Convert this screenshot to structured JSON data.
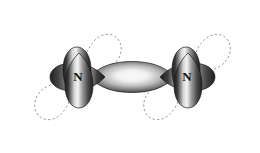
{
  "figure": {
    "background_color": "#ffffff",
    "width": 260,
    "height": 153
  },
  "atoms": [
    {
      "label": "N",
      "name": "nitrogen-left",
      "x": 78,
      "y": 77
    },
    {
      "label": "N",
      "name": "nitrogen-right",
      "x": 187,
      "y": 77
    }
  ],
  "colors": {
    "lobe_dark": "#2b2b2b",
    "lobe_mid": "#6e6e6e",
    "lobe_light": "#f2f2f2",
    "lobe_edge": "#1a1a1a",
    "dashed_stroke": "#9a9a9a",
    "label_color": "#111111",
    "background": "#ffffff"
  },
  "orbitals": {
    "solid_count": 7,
    "dashed_count": 4,
    "sigma_bond": {
      "name": "sigma-bond-orbital",
      "cx": 132,
      "cy": 77,
      "rx": 45,
      "ry": 13
    },
    "solid_lobes": [
      {
        "name": "lobe-left-n-top",
        "cx": 78,
        "cy": 41,
        "orientation": "up"
      },
      {
        "name": "lobe-left-n-bottom",
        "cx": 78,
        "cy": 114,
        "orientation": "down"
      },
      {
        "name": "lobe-left-n-left",
        "cx": 40,
        "cy": 77,
        "orientation": "left"
      },
      {
        "name": "lobe-right-n-top",
        "cx": 187,
        "cy": 41,
        "orientation": "up"
      },
      {
        "name": "lobe-right-n-bottom",
        "cx": 187,
        "cy": 114,
        "orientation": "down"
      },
      {
        "name": "lobe-right-n-right",
        "cx": 224,
        "cy": 77,
        "orientation": "right"
      }
    ],
    "dashed_lobes": [
      {
        "name": "dashed-lobe-left-n-upper-right",
        "angle": -42
      },
      {
        "name": "dashed-lobe-left-n-lower-left",
        "angle": 222
      },
      {
        "name": "dashed-lobe-right-n-upper-right",
        "angle": -42
      },
      {
        "name": "dashed-lobe-right-n-lower-left",
        "angle": 222
      }
    ]
  },
  "caption": ""
}
